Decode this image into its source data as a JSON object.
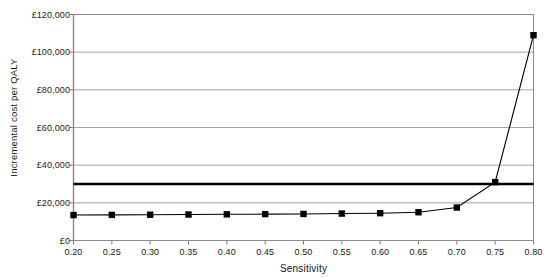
{
  "chart_data": {
    "type": "line",
    "title": "",
    "xlabel": "Sensitivity",
    "ylabel": "Incremental cost per QALY",
    "xlim": [
      0.2,
      0.8
    ],
    "ylim": [
      0,
      120000
    ],
    "grid": "horizontal",
    "legend": "none",
    "x_tick_labels": [
      "0.20",
      "0.25",
      "0.30",
      "0.35",
      "0.40",
      "0.45",
      "0.50",
      "0.55",
      "0.60",
      "0.65",
      "0.70",
      "0.75",
      "0.80"
    ],
    "x_tick_values": [
      0.2,
      0.25,
      0.3,
      0.35,
      0.4,
      0.45,
      0.5,
      0.55,
      0.6,
      0.65,
      0.7,
      0.75,
      0.8
    ],
    "y_tick_labels": [
      "£0",
      "£20,000",
      "£40,000",
      "£60,000",
      "£80,000",
      "£100,000",
      "£120,000"
    ],
    "y_tick_values": [
      0,
      20000,
      40000,
      60000,
      80000,
      100000,
      120000
    ],
    "series": [
      {
        "name": "Incremental cost per QALY",
        "marker": "square",
        "color": "#000000",
        "x": [
          0.2,
          0.25,
          0.3,
          0.35,
          0.4,
          0.45,
          0.5,
          0.55,
          0.6,
          0.65,
          0.7,
          0.75,
          0.8
        ],
        "values": [
          13500,
          13600,
          13700,
          13800,
          13900,
          14000,
          14100,
          14300,
          14500,
          15000,
          17500,
          31000,
          109000
        ]
      },
      {
        "name": "threshold",
        "marker": "none",
        "color": "#000000",
        "style": "thick-horizontal",
        "x": [
          0.2,
          0.8
        ],
        "values": [
          30000,
          30000
        ]
      }
    ]
  },
  "axes": {
    "x_axis_title": "Sensitivity",
    "y_axis_title": "Incremental cost per QALY"
  }
}
